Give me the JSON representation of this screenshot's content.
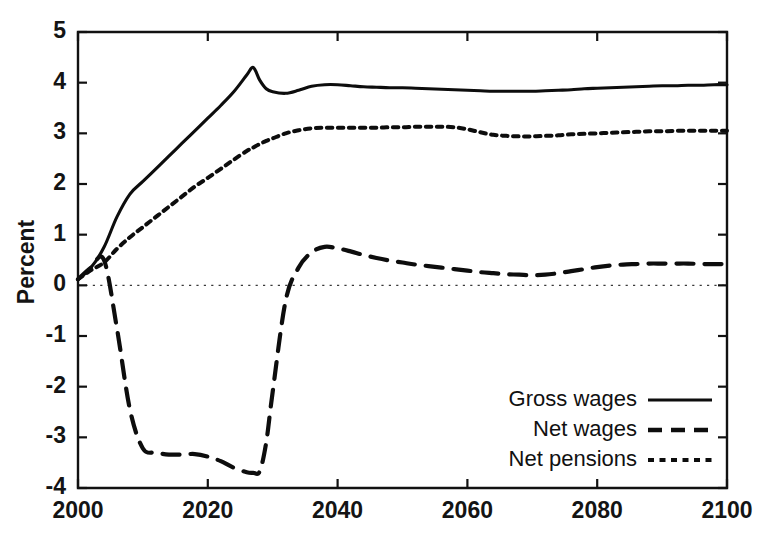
{
  "chart_data": {
    "type": "line",
    "title": "",
    "subtitle": "",
    "xlabel": "",
    "ylabel": "Percent",
    "xlim": [
      2000,
      2100
    ],
    "ylim": [
      -4,
      5
    ],
    "grid": false,
    "zero_line": true,
    "legend_position": "bottom-right",
    "x_ticks": [
      2000,
      2020,
      2040,
      2060,
      2080,
      2100
    ],
    "x_tick_labels": [
      "2000",
      "2020",
      "2040",
      "2060",
      "2080",
      "2100"
    ],
    "y_ticks": [
      -4,
      -3,
      -2,
      -1,
      0,
      1,
      2,
      3,
      4,
      5
    ],
    "y_tick_labels": [
      "-4",
      "-3",
      "-2",
      "-1",
      "0",
      "1",
      "2",
      "3",
      "4",
      "5"
    ],
    "x": [
      2000,
      2002,
      2004,
      2006,
      2008,
      2010,
      2012,
      2014,
      2016,
      2018,
      2020,
      2022,
      2024,
      2026,
      2027,
      2028,
      2029,
      2030,
      2032,
      2034,
      2036,
      2038,
      2040,
      2042,
      2044,
      2046,
      2048,
      2050,
      2052,
      2054,
      2056,
      2058,
      2060,
      2062,
      2064,
      2066,
      2068,
      2070,
      2072,
      2074,
      2076,
      2078,
      2080,
      2082,
      2084,
      2086,
      2088,
      2090,
      2092,
      2094,
      2096,
      2098,
      2100
    ],
    "series": [
      {
        "name": "Gross wages",
        "style": "solid",
        "values": [
          0.12,
          0.35,
          0.75,
          1.35,
          1.8,
          2.05,
          2.3,
          2.55,
          2.8,
          3.05,
          3.3,
          3.55,
          3.82,
          4.15,
          4.3,
          4.05,
          3.88,
          3.82,
          3.79,
          3.85,
          3.93,
          3.96,
          3.96,
          3.94,
          3.92,
          3.91,
          3.9,
          3.9,
          3.89,
          3.88,
          3.87,
          3.86,
          3.85,
          3.84,
          3.83,
          3.83,
          3.83,
          3.83,
          3.84,
          3.85,
          3.86,
          3.88,
          3.89,
          3.9,
          3.91,
          3.92,
          3.93,
          3.94,
          3.94,
          3.95,
          3.95,
          3.96,
          3.96
        ]
      },
      {
        "name": "Net wages",
        "style": "dashed",
        "values": [
          0.12,
          0.35,
          0.5,
          -0.85,
          -2.45,
          -3.22,
          -3.3,
          -3.34,
          -3.34,
          -3.33,
          -3.38,
          -3.47,
          -3.6,
          -3.69,
          -3.7,
          -3.67,
          -3.1,
          -2.1,
          -0.3,
          0.35,
          0.65,
          0.76,
          0.73,
          0.67,
          0.6,
          0.54,
          0.49,
          0.45,
          0.41,
          0.38,
          0.35,
          0.32,
          0.29,
          0.26,
          0.24,
          0.22,
          0.21,
          0.2,
          0.21,
          0.24,
          0.28,
          0.32,
          0.36,
          0.39,
          0.41,
          0.42,
          0.43,
          0.43,
          0.43,
          0.43,
          0.42,
          0.42,
          0.42
        ]
      },
      {
        "name": "Net pensions",
        "style": "dotted",
        "values": [
          0.12,
          0.3,
          0.45,
          0.72,
          0.95,
          1.15,
          1.35,
          1.55,
          1.75,
          1.95,
          2.12,
          2.3,
          2.48,
          2.65,
          2.72,
          2.79,
          2.85,
          2.9,
          3.0,
          3.06,
          3.1,
          3.11,
          3.11,
          3.11,
          3.11,
          3.11,
          3.12,
          3.12,
          3.13,
          3.13,
          3.13,
          3.12,
          3.08,
          3.02,
          2.97,
          2.95,
          2.94,
          2.94,
          2.95,
          2.96,
          2.98,
          2.99,
          3.0,
          3.01,
          3.02,
          3.03,
          3.04,
          3.04,
          3.05,
          3.05,
          3.05,
          3.05,
          3.05
        ]
      }
    ],
    "legend_entries": [
      {
        "label": "Gross wages",
        "style": "solid"
      },
      {
        "label": "Net wages",
        "style": "dashed"
      },
      {
        "label": "Net pensions",
        "style": "dotted"
      }
    ]
  }
}
